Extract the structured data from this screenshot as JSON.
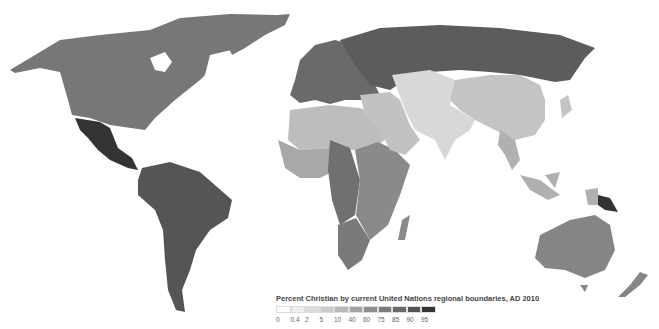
{
  "chart_data": {
    "type": "choropleth",
    "title": "Percent Christian by current United Nations regional boundaries, AD 2010",
    "legend": {
      "position": "bottom-center",
      "breaks": [
        "0",
        "0.4",
        "2",
        "5",
        "10",
        "40",
        "60",
        "75",
        "85",
        "90",
        "95"
      ],
      "colors": [
        "#ffffff",
        "#eeeeee",
        "#dcdcdc",
        "#cbcbcb",
        "#b8b8b8",
        "#a3a3a3",
        "#8d8d8d",
        "#7a7a7a",
        "#686868",
        "#555555",
        "#333333"
      ]
    },
    "regions": [
      {
        "name": "Northern America",
        "bin": "75-85",
        "color": "#777777"
      },
      {
        "name": "Central America",
        "bin": "95+",
        "color": "#333333"
      },
      {
        "name": "Caribbean",
        "bin": "75-85",
        "color": "#777777"
      },
      {
        "name": "South America",
        "bin": "90-95",
        "color": "#555555"
      },
      {
        "name": "Northern Europe",
        "bin": "75-85",
        "color": "#6e6e6e"
      },
      {
        "name": "Western Europe",
        "bin": "75-85",
        "color": "#6e6e6e"
      },
      {
        "name": "Southern Europe",
        "bin": "75-85",
        "color": "#6e6e6e"
      },
      {
        "name": "Eastern Europe",
        "bin": "85-90",
        "color": "#606060"
      },
      {
        "name": "Northern Africa",
        "bin": "5-10",
        "color": "#bdbdbd"
      },
      {
        "name": "Western Africa",
        "bin": "40-60",
        "color": "#a8a8a8"
      },
      {
        "name": "Middle Africa",
        "bin": "75-85",
        "color": "#707070"
      },
      {
        "name": "Eastern Africa",
        "bin": "60-75",
        "color": "#8a8a8a"
      },
      {
        "name": "Southern Africa",
        "bin": "75-85",
        "color": "#7a7a7a"
      },
      {
        "name": "Western Asia",
        "bin": "5-10",
        "color": "#c2c2c2"
      },
      {
        "name": "South-central Asia",
        "bin": "2-5",
        "color": "#d8d8d8"
      },
      {
        "name": "Eastern Asia",
        "bin": "5-10",
        "color": "#c4c4c4"
      },
      {
        "name": "South-eastern Asia",
        "bin": "10-40",
        "color": "#b0b0b0"
      },
      {
        "name": "Australia/New Zealand",
        "bin": "60-75",
        "color": "#858585"
      },
      {
        "name": "Melanesia",
        "bin": "95+",
        "color": "#333333"
      }
    ]
  }
}
